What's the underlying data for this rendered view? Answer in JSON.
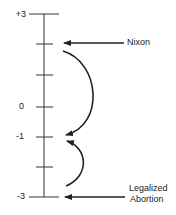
{
  "scale": {
    "ticks": [
      {
        "value": 3,
        "label": "+3",
        "y": 14
      },
      {
        "value": 2,
        "label": "",
        "y": 44
      },
      {
        "value": 1,
        "label": "",
        "y": 75
      },
      {
        "value": 0,
        "label": "0",
        "y": 107
      },
      {
        "value": -1,
        "label": "-1",
        "y": 137
      },
      {
        "value": -2,
        "label": "",
        "y": 167
      },
      {
        "value": -3,
        "label": "-3",
        "y": 197
      }
    ]
  },
  "annotations": {
    "nixon": {
      "label": "Nixon",
      "points_to": 2
    },
    "abortion": {
      "line1": "Legalized",
      "line2": "Abortion",
      "points_to": -3
    }
  },
  "arrows": [
    {
      "from": 2,
      "to": -1,
      "description": "curved arrow from +2 down to -1"
    },
    {
      "from": -3,
      "to": -1,
      "description": "curved arrow from -3 up to -1"
    }
  ],
  "colors": {
    "ink": "#222222"
  }
}
